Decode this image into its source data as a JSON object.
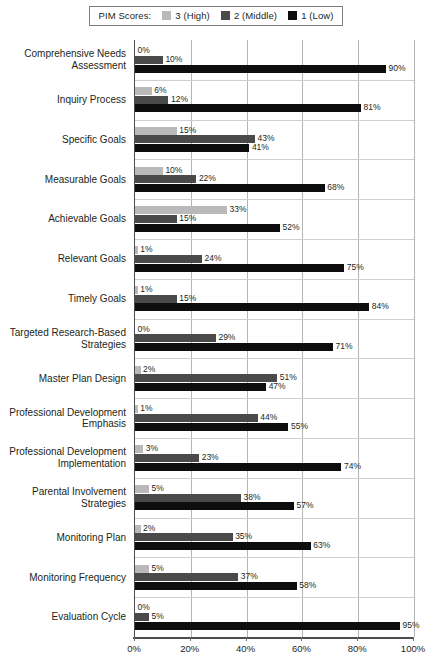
{
  "legend": {
    "title": "PIM Scores:",
    "items": [
      {
        "label": "3 (High)",
        "color": "#b9b9b9",
        "key": "s3"
      },
      {
        "label": "2 (Middle)",
        "color": "#4a4a4a",
        "key": "s2"
      },
      {
        "label": "1 (Low)",
        "color": "#0d0d0d",
        "key": "s1"
      }
    ]
  },
  "chart_data": {
    "type": "bar",
    "orientation": "horizontal",
    "title": "",
    "xlabel": "",
    "ylabel": "",
    "xlim": [
      0,
      100
    ],
    "xticks": [
      "0%",
      "20%",
      "40%",
      "60%",
      "80%",
      "100%"
    ],
    "xtick_values": [
      0,
      20,
      40,
      60,
      80,
      100
    ],
    "grid": true,
    "legend_position": "top-center",
    "value_suffix": "%",
    "categories": [
      "Comprehensive Needs Assessment",
      "Inquiry Process",
      "Specific Goals",
      "Measurable Goals",
      "Achievable Goals",
      "Relevant Goals",
      "Timely Goals",
      "Targeted Research-Based Strategies",
      "Master Plan Design",
      "Professional Development Emphasis",
      "Professional Development Implementation",
      "Parental Involvement Strategies",
      "Monitoring Plan",
      "Monitoring Frequency",
      "Evaluation Cycle"
    ],
    "category_lines": [
      [
        "Comprehensive Needs",
        "Assessment"
      ],
      [
        "Inquiry Process"
      ],
      [
        "Specific Goals"
      ],
      [
        "Measurable Goals"
      ],
      [
        "Achievable Goals"
      ],
      [
        "Relevant Goals"
      ],
      [
        "Timely Goals"
      ],
      [
        "Targeted Research-Based",
        "Strategies"
      ],
      [
        "Master Plan Design"
      ],
      [
        "Professional Development",
        "Emphasis"
      ],
      [
        "Professional Development",
        "Implementation"
      ],
      [
        "Parental Involvement",
        "Strategies"
      ],
      [
        "Monitoring Plan"
      ],
      [
        "Monitoring Frequency"
      ],
      [
        "Evaluation Cycle"
      ]
    ],
    "series": [
      {
        "name": "3 (High)",
        "color": "#b9b9b9",
        "values": [
          0,
          6,
          15,
          10,
          33,
          1,
          1,
          0,
          2,
          1,
          3,
          5,
          2,
          5,
          0
        ],
        "labels": [
          "0%",
          "6%",
          "15%",
          "10%",
          "33%",
          "1%",
          "1%",
          "0%",
          "2%",
          "1%",
          "3%",
          "5%",
          "2%",
          "5%",
          "0%"
        ]
      },
      {
        "name": "2 (Middle)",
        "color": "#4a4a4a",
        "values": [
          10,
          12,
          43,
          22,
          15,
          24,
          15,
          29,
          51,
          44,
          23,
          38,
          35,
          37,
          5
        ],
        "labels": [
          "10%",
          "12%",
          "43%",
          "22%",
          "15%",
          "24%",
          "15%",
          "29%",
          "51%",
          "44%",
          "23%",
          "38%",
          "35%",
          "37%",
          "5%"
        ]
      },
      {
        "name": "1 (Low)",
        "color": "#0d0d0d",
        "values": [
          90,
          81,
          41,
          68,
          52,
          75,
          84,
          71,
          47,
          55,
          74,
          57,
          63,
          58,
          95
        ],
        "labels": [
          "90%",
          "81%",
          "41%",
          "68%",
          "52%",
          "75%",
          "84%",
          "71%",
          "47%",
          "55%",
          "74%",
          "57%",
          "63%",
          "58%",
          "95%"
        ]
      }
    ]
  }
}
